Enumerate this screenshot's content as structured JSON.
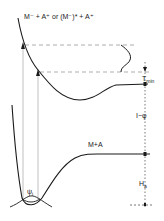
{
  "diagram": {
    "type": "potential-energy-curves",
    "curves": {
      "upper": {
        "label": "M⁻ + A⁺ or (M⁻)* + A⁺"
      },
      "lower": {
        "label": "M+A"
      }
    },
    "wavefunction_label": "ψ",
    "wavefunction_subscript": "i",
    "energy_markers": {
      "t_min": {
        "main": "T",
        "sub": "min"
      },
      "i_minus_phi": "I−φ",
      "h_a": {
        "main": "H",
        "sub": "a"
      }
    },
    "colors": {
      "line": "#1a1a1a",
      "dashed": "#8a8a8a",
      "vertical": "#b0b0b0",
      "background": "#ffffff"
    }
  }
}
